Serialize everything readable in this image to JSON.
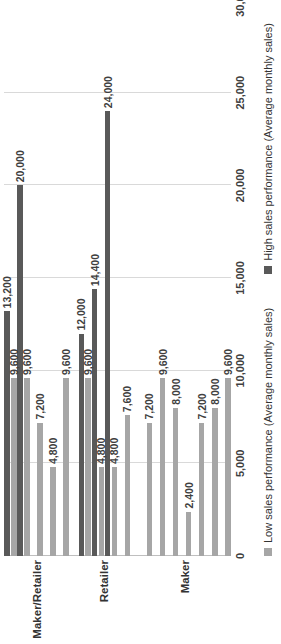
{
  "chart_data": {
    "type": "bar",
    "orientation": "horizontal",
    "title": "",
    "xlabel": "",
    "ylabel": "Maker/Retailer",
    "xlim": [
      0,
      30000
    ],
    "grid": true,
    "legend_position": "bottom",
    "axis_ticks": [
      "0",
      "5,000",
      "10,000",
      "15,000",
      "20,000",
      "25,000",
      "30,000"
    ],
    "axis_tick_values": [
      0,
      5000,
      10000,
      15000,
      20000,
      25000,
      30000
    ],
    "category_axis_title": "Maker/Retailer",
    "group_labels": [
      "Maker/Retailer",
      "Retailer",
      "Maker"
    ],
    "series": [
      {
        "name": "Low sales performance (Average monthly sales)",
        "color": "#a6a6a6"
      },
      {
        "name": "High sales performance (Average monthly sales)",
        "color": "#595959"
      }
    ],
    "groups": [
      {
        "label": "Maker/Retailer",
        "items": [
          {
            "low": 9600,
            "low_label": "9,600",
            "high": 13200,
            "high_label": "13,200"
          },
          {
            "low": 9600,
            "low_label": "9,600",
            "high": 20000,
            "high_label": "20,000"
          },
          {
            "low": 7200,
            "low_label": "7,200",
            "high": null,
            "high_label": ""
          },
          {
            "low": 4800,
            "low_label": "4,800",
            "high": null,
            "high_label": ""
          },
          {
            "low": 9600,
            "low_label": "9,600",
            "high": null,
            "high_label": ""
          }
        ]
      },
      {
        "label": "Retailer",
        "items": [
          {
            "low": 9600,
            "low_label": "9,600",
            "high": 12000,
            "high_label": "12,000"
          },
          {
            "low": 4800,
            "low_label": "4,800",
            "high": 14400,
            "high_label": "14,400"
          },
          {
            "low": 4800,
            "low_label": "4,800",
            "high": 24000,
            "high_label": "24,000"
          },
          {
            "low": 7600,
            "low_label": "7,600",
            "high": null,
            "high_label": ""
          }
        ]
      },
      {
        "label": "Maker",
        "items": [
          {
            "low": 7200,
            "low_label": "7,200",
            "high": null,
            "high_label": ""
          },
          {
            "low": 9600,
            "low_label": "9,600",
            "high": null,
            "high_label": ""
          },
          {
            "low": 8000,
            "low_label": "8,000",
            "high": null,
            "high_label": ""
          },
          {
            "low": 2400,
            "low_label": "2,400",
            "high": null,
            "high_label": ""
          },
          {
            "low": 7200,
            "low_label": "7,200",
            "high": null,
            "high_label": ""
          },
          {
            "low": 8000,
            "low_label": "8,000",
            "high": null,
            "high_label": ""
          },
          {
            "low": 9600,
            "low_label": "9,600",
            "high": null,
            "high_label": ""
          }
        ]
      }
    ]
  }
}
